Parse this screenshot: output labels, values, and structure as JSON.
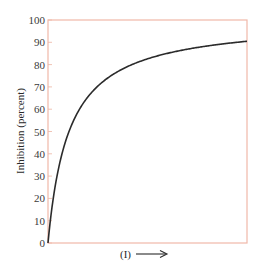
{
  "chart_data": {
    "type": "line",
    "title": "",
    "xlabel": "(I)",
    "xlabel_arrow": "right-arrow",
    "ylabel": "Inhibition (percent)",
    "ylim": [
      0,
      100
    ],
    "xlim": [
      0,
      10
    ],
    "yticks": [
      "0",
      "10",
      "20",
      "30",
      "40",
      "50",
      "60",
      "70",
      "80",
      "90",
      "100"
    ],
    "xticks": [],
    "grid": false,
    "legend": null,
    "colors": {
      "frame": "#f0b8a8",
      "tick": "#f0c4b6",
      "curve": "#2b2b2b",
      "text": "#3a3a3a"
    },
    "series": [
      {
        "name": "Inhibition",
        "x": [
          0,
          0.1,
          0.25,
          0.5,
          0.75,
          1,
          1.5,
          2,
          2.5,
          3,
          4,
          5,
          6,
          7,
          8,
          9,
          10
        ],
        "values": [
          0,
          8.7,
          19.2,
          32.1,
          41.5,
          48.7,
          58.7,
          65.5,
          70.3,
          74.0,
          79.1,
          82.6,
          85.0,
          86.9,
          88.3,
          89.5,
          90.5
        ]
      }
    ]
  }
}
